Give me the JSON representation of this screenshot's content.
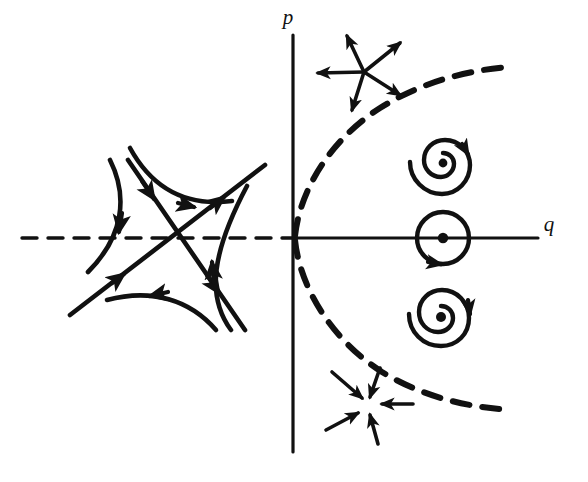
{
  "figure": {
    "kind": "phase-plane-classification-diagram",
    "background_color": "#ffffff",
    "ink_color": "#111111",
    "width": 588,
    "height": 482
  },
  "axes": {
    "origin": {
      "x": 293,
      "y": 238
    },
    "vertical": {
      "label": "p",
      "label_x": 288,
      "label_y": 24,
      "style": "solid",
      "x": 293,
      "y_top": 35,
      "y_bottom": 452
    },
    "horizontal": {
      "label": "q",
      "label_x": 549,
      "label_y": 231,
      "positive_style": "solid",
      "negative_style": "dashed",
      "y": 238,
      "x_left": 22,
      "x_right": 538
    }
  },
  "boundary_curve": {
    "name": "discriminant-parabola",
    "style": "dashed",
    "dash_pattern": "16 12",
    "stroke_width": 6,
    "vertex": {
      "x": 293,
      "y": 238
    },
    "opens": "right",
    "upper_end": {
      "x": 508,
      "y": 67
    },
    "lower_end": {
      "x": 512,
      "y": 410
    }
  },
  "features": [
    {
      "id": "saddle",
      "name": "saddle-point",
      "label": "",
      "center": {
        "x": 172,
        "y": 238
      },
      "region": "q < 0"
    },
    {
      "id": "unstable-node",
      "name": "unstable-node-star",
      "label": "",
      "center": {
        "x": 364,
        "y": 72
      },
      "region": "above parabola, p > 0",
      "arrow_direction": "outward",
      "rays": 5
    },
    {
      "id": "stable-node",
      "name": "stable-node-star",
      "label": "",
      "center": {
        "x": 368,
        "y": 404
      },
      "region": "below parabola, p < 0",
      "arrow_direction": "inward",
      "rays": 5
    },
    {
      "id": "unstable-spiral",
      "name": "unstable-spiral-focus",
      "label": "",
      "center": {
        "x": 443,
        "y": 163
      },
      "region": "inside parabola, p > 0",
      "rotation": "counterclockwise-outward"
    },
    {
      "id": "center",
      "name": "center-closed-orbit",
      "label": "",
      "center": {
        "x": 443,
        "y": 238
      },
      "region": "on positive q axis",
      "radius": 26
    },
    {
      "id": "stable-spiral",
      "name": "stable-spiral-focus",
      "label": "",
      "center": {
        "x": 443,
        "y": 317
      },
      "region": "inside parabola, p < 0",
      "rotation": "clockwise-inward"
    }
  ]
}
